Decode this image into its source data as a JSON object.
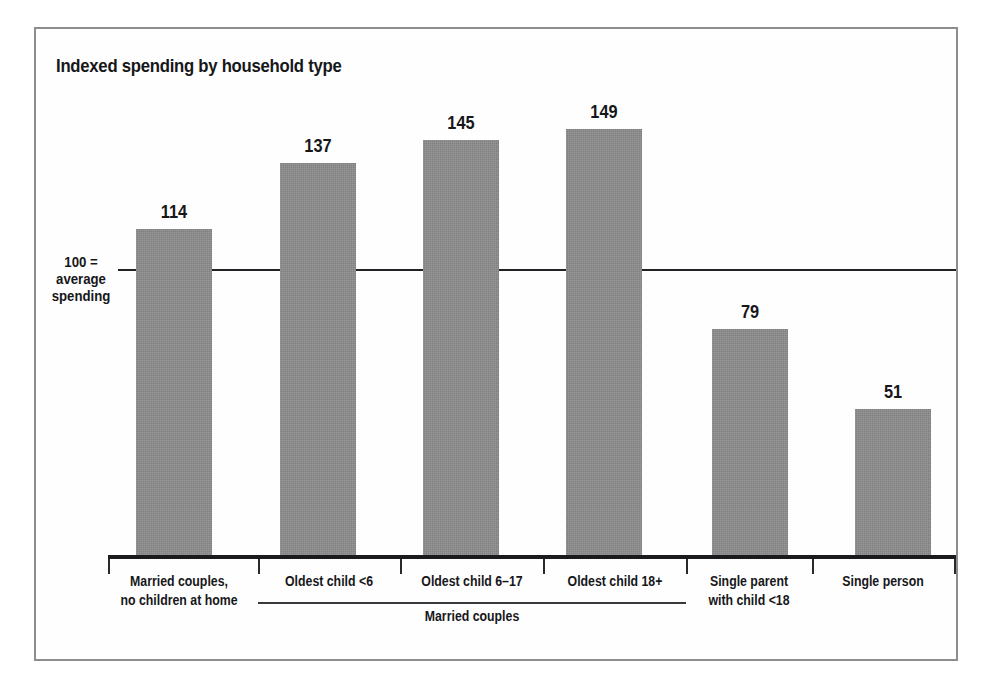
{
  "chart_data": {
    "type": "bar",
    "title": "Indexed spending by household type",
    "xlabel": "",
    "ylabel": "",
    "ylim": [
      0,
      160
    ],
    "grid": false,
    "legend": "none",
    "reference_line": {
      "value": 100,
      "label_line1": "100 =",
      "label_line2": "average",
      "label_line3": "spending"
    },
    "categories": [
      "Married couples, no children at home",
      "Oldest child <6",
      "Oldest child 6–17",
      "Oldest child 18+",
      "Single parent with child <18",
      "Single person"
    ],
    "category_lines": [
      [
        "Married couples,",
        "no children at home"
      ],
      [
        "Oldest child <6"
      ],
      [
        "Oldest child 6–17"
      ],
      [
        "Oldest child 18+"
      ],
      [
        "Single parent",
        "with child <18"
      ],
      [
        "Single person"
      ]
    ],
    "values": [
      114,
      137,
      145,
      149,
      79,
      51
    ],
    "value_labels": [
      "114",
      "137",
      "145",
      "149",
      "79",
      "51"
    ],
    "group_bracket": {
      "label": "Married couples",
      "spans_categories": [
        1,
        2,
        3
      ]
    },
    "colors": {
      "bar_fill": "#8b8b8b",
      "axis": "#1b1b1f",
      "text": "#17171a",
      "frame": "#8d8d8d",
      "background": "#ffffff"
    }
  }
}
